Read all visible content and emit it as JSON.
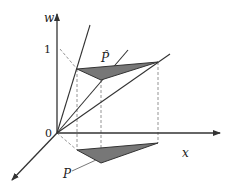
{
  "figure": {
    "labels": {
      "w_axis": "w",
      "x_axis": "x",
      "origin": "0",
      "one_tick": "1",
      "p_hat": "P̂",
      "p": "P"
    },
    "colors": {
      "line": "#333333",
      "fill": "#777777",
      "dashed": "#888888",
      "background": "#ffffff"
    }
  }
}
